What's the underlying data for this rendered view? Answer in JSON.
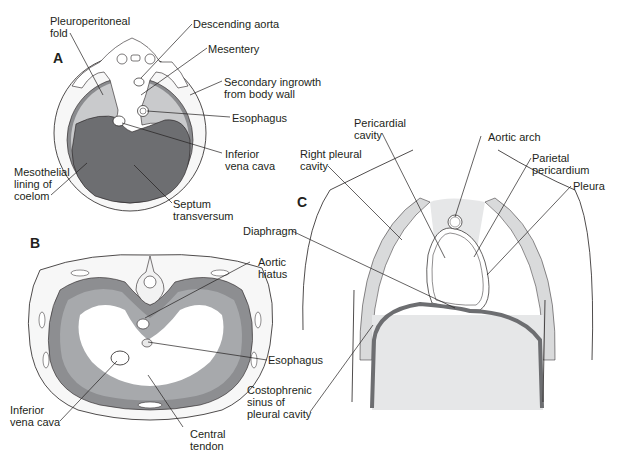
{
  "figure": {
    "panels": {
      "A": {
        "letter": "A",
        "view": "transverse section of embryo showing diaphragm development"
      },
      "B": {
        "letter": "B",
        "view": "inferior view of adult diaphragm"
      },
      "C": {
        "letter": "C",
        "view": "coronal section of thorax"
      }
    },
    "labels_A": {
      "pleuroperitoneal_fold": "Pleuroperitoneal\nfold",
      "descending_aorta": "Descending aorta",
      "mesentery": "Mesentery",
      "secondary_ingrowth": "Secondary ingrowth\nfrom body wall",
      "esophagus": "Esophagus",
      "inferior_vena_cava": "Inferior\nvena cava",
      "mesothelial_lining": "Mesothelial\nlining of\ncoelom",
      "septum_transversum": "Septum\ntransversum"
    },
    "labels_B": {
      "aortic_hiatus": "Aortic\nhiatus",
      "esophagus": "Esophagus",
      "inferior_vena_cava": "Inferior\nvena cava",
      "central_tendon": "Central\ntendon"
    },
    "labels_C": {
      "pericardial_cavity": "Pericardial\ncavity",
      "aortic_arch": "Aortic arch",
      "right_pleural_cavity": "Right pleural\ncavity",
      "parietal_pericardium": "Parietal\npericardium",
      "pleura": "Pleura",
      "diaphragm": "Diaphragm",
      "costophrenic_sinus": "Costophrenic\nsinus of\npleural cavity"
    },
    "colors": {
      "ink": "#231f20",
      "dark_gray": "#6d6e71",
      "mid_gray": "#a7a9ac",
      "light_gray": "#d9dadb",
      "pale_gray": "#eeeeee",
      "white": "#ffffff"
    }
  }
}
